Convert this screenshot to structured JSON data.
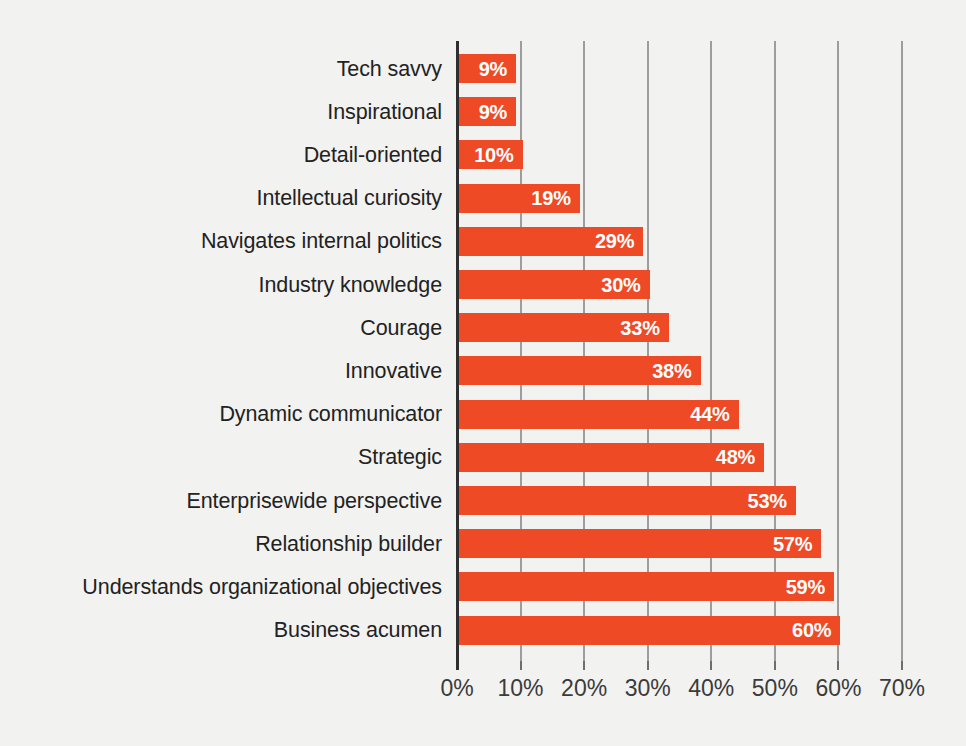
{
  "chart_data": {
    "type": "bar",
    "orientation": "horizontal",
    "title": "",
    "xlabel": "",
    "ylabel": "",
    "xlim": [
      0,
      70
    ],
    "xticks": [
      0,
      10,
      20,
      30,
      40,
      50,
      60,
      70
    ],
    "xtick_labels": [
      "0%",
      "10%",
      "20%",
      "30%",
      "40%",
      "50%",
      "60%",
      "70%"
    ],
    "grid": true,
    "legend": false,
    "value_label_suffix": "%",
    "colors": {
      "bar": "#ee4a26",
      "background": "#f2f2f0",
      "gridline": "#9d9d9d",
      "axis_line": "#2f2f2f",
      "category_label": "#222222",
      "value_label": "#ffffff",
      "tick_label": "#3b3b3b"
    },
    "categories": [
      "Tech savvy",
      "Inspirational",
      "Detail-oriented",
      "Intellectual curiosity",
      "Navigates internal politics",
      "Industry knowledge",
      "Courage",
      "Innovative",
      "Dynamic communicator",
      "Strategic",
      "Enterprisewide perspective",
      "Relationship builder",
      "Understands organizational objectives",
      "Business acumen"
    ],
    "values": [
      9,
      9,
      10,
      19,
      29,
      30,
      33,
      38,
      44,
      48,
      53,
      57,
      59,
      60
    ],
    "value_labels": [
      "9%",
      "9%",
      "10%",
      "19%",
      "29%",
      "30%",
      "33%",
      "38%",
      "44%",
      "48%",
      "53%",
      "57%",
      "59%",
      "60%"
    ]
  }
}
